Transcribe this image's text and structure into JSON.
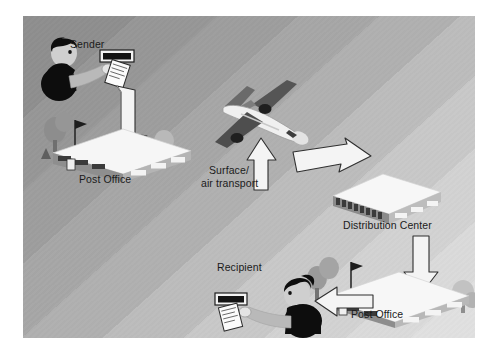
{
  "diagram": {
    "background": {
      "light": "#e0e0e0",
      "dark": "#8e8e8e",
      "frame": "#ffffff"
    },
    "labels": {
      "sender": "Sender",
      "post_office_origin": "Post Office",
      "transport_line1": "Surface/",
      "transport_line2": "air transport",
      "distribution_center": "Distribution Center",
      "post_office_destination": "Post Office",
      "recipient": "Recipient"
    },
    "nodes": [
      {
        "name": "sender",
        "label": "Sender",
        "type": "person",
        "x": 30,
        "y": 22
      },
      {
        "name": "post-office-origin",
        "label": "Post Office",
        "type": "building",
        "x": 30,
        "y": 110
      },
      {
        "name": "airplane",
        "label": "Surface/ air transport",
        "type": "vehicle",
        "x": 205,
        "y": 85
      },
      {
        "name": "distribution-center",
        "label": "Distribution Center",
        "type": "building",
        "x": 320,
        "y": 165
      },
      {
        "name": "post-office-destination",
        "label": "Post Office",
        "type": "building",
        "x": 285,
        "y": 250
      },
      {
        "name": "recipient",
        "label": "Recipient",
        "type": "person",
        "x": 215,
        "y": 262
      }
    ],
    "arrows": [
      {
        "name": "arrow-sender-to-post-office",
        "direction": "down",
        "from": "sender",
        "to": "post-office-origin"
      },
      {
        "name": "arrow-post-office-to-transport",
        "direction": "up",
        "from": "post-office-origin",
        "to": "airplane"
      },
      {
        "name": "arrow-transport-to-distribution",
        "direction": "right-down",
        "from": "airplane",
        "to": "distribution-center"
      },
      {
        "name": "arrow-distribution-to-post-office",
        "direction": "down",
        "from": "distribution-center",
        "to": "post-office-destination"
      },
      {
        "name": "arrow-post-office-to-recipient",
        "direction": "left",
        "from": "post-office-destination",
        "to": "recipient"
      }
    ],
    "colors": {
      "arrow_fill": "#f2f2f2",
      "arrow_stroke": "#3a3a3a",
      "building_roof": "#f4f4f4",
      "building_wall": "#9a9a9a",
      "person_dark": "#111111",
      "person_skin": "#c9c9c9",
      "plane_body": "#efefef",
      "plane_wing": "#4a4a4a",
      "tree": "#8f8f8f",
      "label_text": "#1b1b1b"
    }
  }
}
